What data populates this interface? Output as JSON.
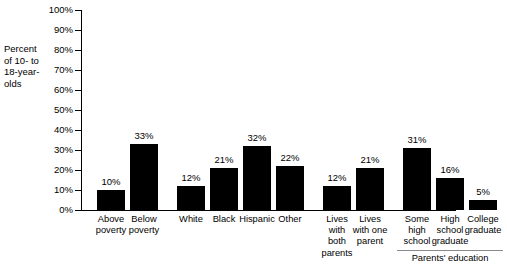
{
  "chart_data": {
    "type": "bar",
    "title": "",
    "subtitle": "",
    "xlabel": "",
    "ylabel": "Percent of 10- to 18-year-olds",
    "ylabel_lines": [
      "Percent",
      "of 10- to",
      "18-year-",
      "olds"
    ],
    "ylim": [
      0,
      100
    ],
    "yticks": [
      0,
      10,
      20,
      30,
      40,
      50,
      60,
      70,
      80,
      90,
      100
    ],
    "ytick_labels": [
      "0%",
      "10%",
      "20%",
      "30%",
      "40%",
      "50%",
      "60%",
      "70%",
      "80%",
      "90%",
      "100%"
    ],
    "grid": false,
    "legend": "none",
    "bar_color": "#000000",
    "categories": [
      "Above poverty",
      "Below poverty",
      "White",
      "Black",
      "Hispanic",
      "Other",
      "Lives with both parents",
      "Lives with one parent",
      "Some high school",
      "High school graduate",
      "College graduate"
    ],
    "values": [
      10,
      33,
      12,
      21,
      32,
      22,
      12,
      21,
      31,
      16,
      5
    ],
    "value_labels": [
      "10%",
      "33%",
      "12%",
      "21%",
      "32%",
      "22%",
      "12%",
      "21%",
      "31%",
      "16%",
      "5%"
    ],
    "category_label_lines": [
      [
        "Above",
        "poverty"
      ],
      [
        "Below",
        "poverty"
      ],
      [
        "White"
      ],
      [
        "Black"
      ],
      [
        "Hispanic"
      ],
      [
        "Other"
      ],
      [
        "Lives",
        "with",
        "both",
        "parents"
      ],
      [
        "Lives",
        "with one",
        "parent"
      ],
      [
        "Some",
        "high",
        "school"
      ],
      [
        "High",
        "school",
        "graduate"
      ],
      [
        "College",
        "graduate"
      ]
    ],
    "groups": [
      {
        "name": "poverty",
        "label": "",
        "bars": [
          0,
          1
        ]
      },
      {
        "name": "race",
        "label": "",
        "bars": [
          2,
          3,
          4,
          5
        ]
      },
      {
        "name": "living-arrangement",
        "label": "",
        "bars": [
          6,
          7
        ]
      },
      {
        "name": "parents-education",
        "label": "Parents' education",
        "bars": [
          8,
          9,
          10
        ]
      }
    ],
    "annotations": [
      {
        "text": "Parents' education",
        "type": "group-bracket",
        "group": "parents-education"
      }
    ]
  }
}
